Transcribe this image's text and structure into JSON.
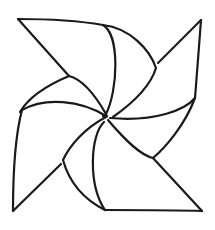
{
  "figure": {
    "style": "line drawing",
    "stroke_color": "#1a1a1a",
    "background_color": "#ffffff",
    "stroke_width": 2.2,
    "hub": {
      "x": 105,
      "y": 116
    },
    "vanes": [
      {
        "name": "top-left",
        "tip": {
          "x": 18,
          "y": 19
        }
      },
      {
        "name": "top-right",
        "tip": {
          "x": 201,
          "y": 20
        }
      },
      {
        "name": "bottom-left",
        "tip": {
          "x": 13,
          "y": 211
        }
      },
      {
        "name": "bottom-right",
        "tip": {
          "x": 202,
          "y": 211
        }
      }
    ]
  }
}
